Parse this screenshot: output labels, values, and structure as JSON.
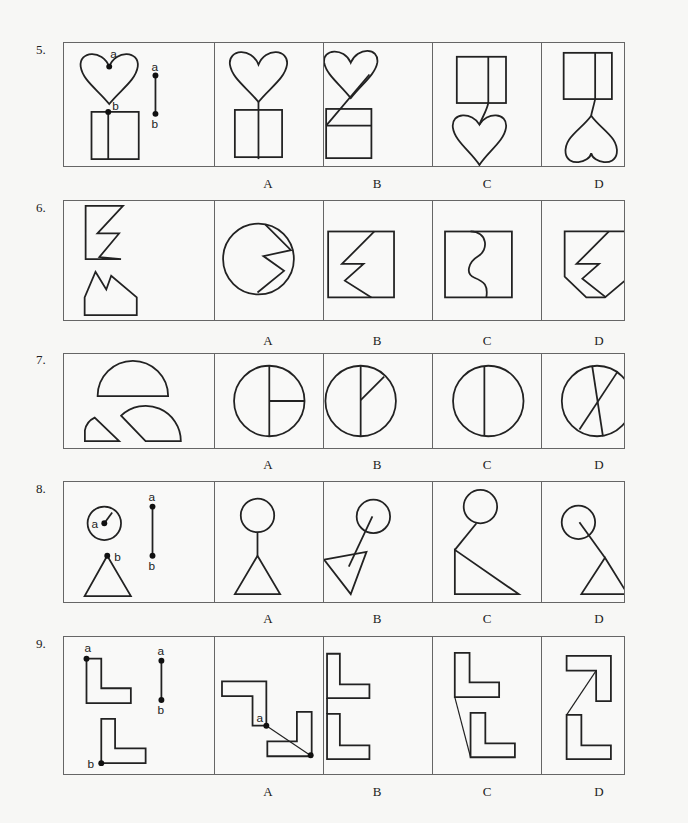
{
  "questions": [
    {
      "number": "5.",
      "prompt_labels": {
        "heart_point": "a",
        "square_point": "b",
        "segment_top": "a",
        "segment_bottom": "b"
      },
      "options": [
        "A",
        "B",
        "C",
        "D"
      ]
    },
    {
      "number": "6.",
      "options": [
        "A",
        "B",
        "C",
        "D"
      ]
    },
    {
      "number": "7.",
      "options": [
        "A",
        "B",
        "C",
        "D"
      ]
    },
    {
      "number": "8.",
      "prompt_labels": {
        "circle_point": "a",
        "triangle_point": "b",
        "segment_top": "a",
        "segment_bottom": "b"
      },
      "options": [
        "A",
        "B",
        "C",
        "D"
      ]
    },
    {
      "number": "9.",
      "prompt_labels": {
        "upper_l_point": "a",
        "lower_l_point": "b",
        "segment_top": "a",
        "segment_bottom": "b",
        "answer_a_point": "a"
      },
      "options": [
        "A",
        "B",
        "C",
        "D"
      ]
    }
  ]
}
